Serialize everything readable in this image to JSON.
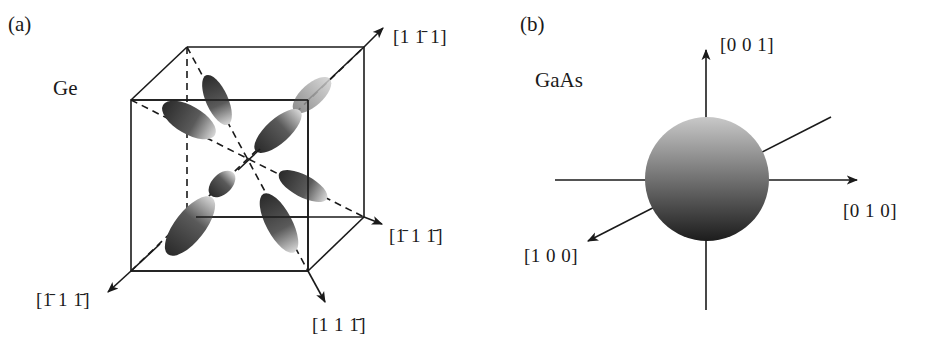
{
  "figure": {
    "panel_a": {
      "label": "(a)",
      "material": "Ge",
      "directions": [
        {
          "id": "dir-1-1bar-1",
          "parts": [
            {
              "t": "[1 "
            },
            {
              "t": "1",
              "bar": true
            },
            {
              "t": " 1]"
            }
          ]
        },
        {
          "id": "dir-1bar-1-1bar-right",
          "parts": [
            {
              "t": "["
            },
            {
              "t": "1",
              "bar": true
            },
            {
              "t": " 1 "
            },
            {
              "t": "1",
              "bar": true
            },
            {
              "t": "]"
            }
          ]
        },
        {
          "id": "dir-1bar-1-1bar-left",
          "parts": [
            {
              "t": "["
            },
            {
              "t": "1",
              "bar": true
            },
            {
              "t": " 1 "
            },
            {
              "t": "1",
              "bar": true
            },
            {
              "t": "]"
            }
          ]
        },
        {
          "id": "dir-1-1-1bar",
          "parts": [
            {
              "t": "[1 1 "
            },
            {
              "t": "1",
              "bar": true
            },
            {
              "t": "]"
            }
          ]
        }
      ],
      "direction_text": {
        "d1": "[1 1̄ 1]",
        "d2": "[1̄ 1 1̄]",
        "d3": "[1̄ 1 1̄]",
        "d4": "[1 1 1̄]"
      },
      "description": "Eight ellipsoidal constant-energy surfaces along <111> directions inside a cube"
    },
    "panel_b": {
      "label": "(b)",
      "material": "GaAs",
      "directions": {
        "z": "[0 0 1]",
        "y": "[0 1 0]",
        "x": "[1 0 0]"
      },
      "description": "Single spherical constant-energy surface at the zone center"
    },
    "colors": {
      "line": "#1a1a1a",
      "ellipsoid_light": "#d8d8d8",
      "ellipsoid_dark": "#2a2a2a",
      "sphere_top": "#c4c4c4",
      "sphere_bottom": "#1e1e1e"
    }
  }
}
